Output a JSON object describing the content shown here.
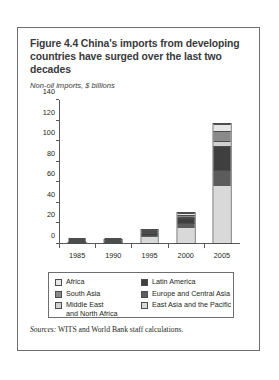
{
  "figure": {
    "title": "Figure 4.4  China's imports from developing countries have surged over the last two decades",
    "subtitle": "Non-oil imports, $ billions",
    "sources_label": "Sources:",
    "sources_text": " WITS and World Bank staff calculations."
  },
  "legend": {
    "left": [
      {
        "label": "Africa",
        "color": "#e6e6e6",
        "name": "africa"
      },
      {
        "label": "South Asia",
        "color": "#8a8a8a",
        "name": "south-asia"
      },
      {
        "label": "Middle East\nand North Africa",
        "color": "#d0d0d0",
        "name": "middle-east-north-africa"
      }
    ],
    "right": [
      {
        "label": "Latin America",
        "color": "#3f3f3f",
        "name": "latin-america"
      },
      {
        "label": "Europe and Central Asia",
        "color": "#5c5c5c",
        "name": "europe-central-asia"
      },
      {
        "label": "East Asia and the Pacific",
        "color": "#d9d9d9",
        "name": "east-asia-pacific"
      }
    ]
  },
  "chart_data": {
    "type": "bar",
    "stacked": true,
    "title": "Figure 4.4  China's imports from developing countries have surged over the last two decades",
    "xlabel": "",
    "ylabel": "Non-oil imports, $ billions",
    "ylim": [
      0,
      140
    ],
    "yticks": [
      0,
      20,
      40,
      60,
      80,
      100,
      120,
      140
    ],
    "grid": false,
    "legend_position": "bottom",
    "categories": [
      "1985",
      "1990",
      "1995",
      "2000",
      "2005"
    ],
    "series": [
      {
        "name": "East Asia and the Pacific",
        "color": "#d9d9d9",
        "values": [
          0.6,
          2.2,
          6.5,
          15.5,
          56.0
        ]
      },
      {
        "name": "Europe and Central Asia",
        "color": "#5c5c5c",
        "values": [
          0.1,
          0.5,
          2.0,
          5.0,
          16.0
        ]
      },
      {
        "name": "Latin America",
        "color": "#3f3f3f",
        "values": [
          0.1,
          1.6,
          2.6,
          5.0,
          24.0
        ]
      },
      {
        "name": "Middle East and North Africa",
        "color": "#d0d0d0",
        "values": [
          0.1,
          0.3,
          1.4,
          1.8,
          4.5
        ]
      },
      {
        "name": "South Asia",
        "color": "#8a8a8a",
        "values": [
          0.05,
          0.2,
          1.3,
          2.2,
          10.0
        ]
      },
      {
        "name": "Africa",
        "color": "#e6e6e6",
        "values": [
          0.05,
          0.2,
          1.2,
          1.5,
          7.5
        ]
      }
    ],
    "totals": [
      1.0,
      5.0,
      15.0,
      31.0,
      118.0
    ]
  }
}
